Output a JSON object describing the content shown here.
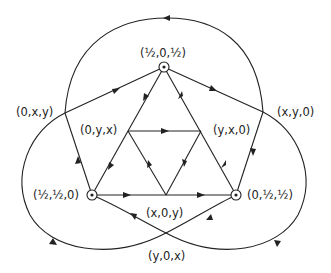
{
  "diagram": {
    "type": "directed graph",
    "line_color": "#222222",
    "background": "#ffffff",
    "nodes": [
      {
        "id": "top",
        "label": "(½, 0, ½)",
        "special": true
      },
      {
        "id": "left_outer",
        "label": "(0, x, y)",
        "special": false
      },
      {
        "id": "right_outer",
        "label": "(x, y, 0)",
        "special": false
      },
      {
        "id": "inner_left",
        "label": "(0, y, x)",
        "special": false
      },
      {
        "id": "inner_right",
        "label": "(y, x, 0)",
        "special": false
      },
      {
        "id": "bottom_left",
        "label": "(½, ½, 0)",
        "special": true
      },
      {
        "id": "bottom_right",
        "label": "(0, ½, ½)",
        "special": true
      },
      {
        "id": "inner_bottom",
        "label": "(x, 0, y)",
        "special": false
      },
      {
        "id": "bottom_cross",
        "label": "(y, 0, x)",
        "special": false
      }
    ],
    "edges": [
      {
        "from": "left_outer",
        "to": "top"
      },
      {
        "from": "top",
        "to": "right_outer"
      },
      {
        "from": "bottom_left",
        "to": "left_outer"
      },
      {
        "from": "right_outer",
        "to": "bottom_right"
      },
      {
        "from": "top",
        "to": "inner_left"
      },
      {
        "from": "inner_left",
        "to": "bottom_left"
      },
      {
        "from": "bottom_right",
        "to": "inner_right"
      },
      {
        "from": "inner_right",
        "to": "top"
      },
      {
        "from": "bottom_left",
        "to": "inner_bottom"
      },
      {
        "from": "inner_bottom",
        "to": "bottom_right"
      },
      {
        "from": "inner_left",
        "to": "inner_right"
      },
      {
        "from": "inner_bottom",
        "to": "inner_left"
      },
      {
        "from": "inner_right",
        "to": "inner_bottom"
      },
      {
        "from": "bottom_cross",
        "to": "bottom_left"
      },
      {
        "from": "bottom_right",
        "to": "bottom_cross"
      },
      {
        "from": "right_outer",
        "to": "left_outer",
        "curve": "outer top arc"
      },
      {
        "from": "left_outer",
        "to": "bottom_cross",
        "curve": "outer left arc"
      },
      {
        "from": "bottom_cross",
        "to": "right_outer",
        "curve": "outer right arc"
      }
    ]
  },
  "labels": {
    "top": "(½,0,½)",
    "left_outer": "(0,x,y)",
    "right_outer": "(x,y,0)",
    "inner_left": "(0,y,x)",
    "inner_right": "(y,x,0)",
    "bottom_left": "(½,½,0)",
    "bottom_right": "(0,½,½)",
    "inner_bottom": "(x,0,y)",
    "bottom_cross": "(y,0,x)"
  }
}
